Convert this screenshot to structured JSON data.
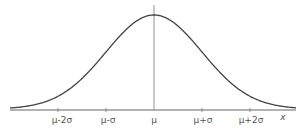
{
  "chart_data": {
    "type": "line",
    "xlabel": "x",
    "ylabel": "",
    "tick_labels": [
      "μ-2σ",
      "μ-σ",
      "μ",
      "μ+σ",
      "μ+2σ"
    ],
    "x": [
      -3,
      -2.5,
      -2,
      -1.5,
      -1,
      -0.5,
      0,
      0.5,
      1,
      1.5,
      2,
      2.5,
      3
    ],
    "values": [
      0.011,
      0.044,
      0.135,
      0.325,
      0.607,
      0.882,
      1.0,
      0.882,
      0.607,
      0.325,
      0.135,
      0.044,
      0.011
    ],
    "annotations": [
      "vertical line at μ"
    ],
    "grid": false,
    "colors": {
      "curve": "#444444",
      "axis": "#555555"
    }
  },
  "labels": {
    "m2s": "μ-2σ",
    "m1s": "μ-σ",
    "mu": "μ",
    "p1s": "μ+σ",
    "p2s": "μ+2σ",
    "x": "x"
  }
}
